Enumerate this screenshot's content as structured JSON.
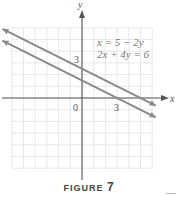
{
  "chart_data": {
    "type": "line",
    "title": "",
    "xlabel": "x",
    "ylabel": "y",
    "xlim": [
      -6,
      6
    ],
    "ylim": [
      -6,
      6
    ],
    "grid": true,
    "tick_labels": {
      "origin": "0",
      "x": [
        "3"
      ],
      "y": [
        "3"
      ]
    },
    "series": [
      {
        "name": "x = 5 − 2y",
        "equation": "x = 5 - 2y",
        "slope": -0.5,
        "y_intercept": 2.5,
        "x_intercept": 5
      },
      {
        "name": "2x + 4y = 6",
        "equation": "2x + 4y = 6",
        "slope": -0.5,
        "y_intercept": 1.5,
        "x_intercept": 3
      }
    ],
    "legend": [
      "x = 5 − 2y",
      "2x + 4y = 6"
    ],
    "legend_position": "upper right"
  },
  "axes": {
    "x_label": "x",
    "y_label": "y",
    "origin_label": "0",
    "x_tick": "3",
    "y_tick": "3"
  },
  "legend": {
    "line1": "x = 5 − 2y",
    "line2": "2x + 4y = 6"
  },
  "caption": {
    "word": "FIGURE",
    "number": "7"
  },
  "colors": {
    "line": "#8a8a8a",
    "axis": "#555555",
    "grid": "#e4e4e4"
  }
}
